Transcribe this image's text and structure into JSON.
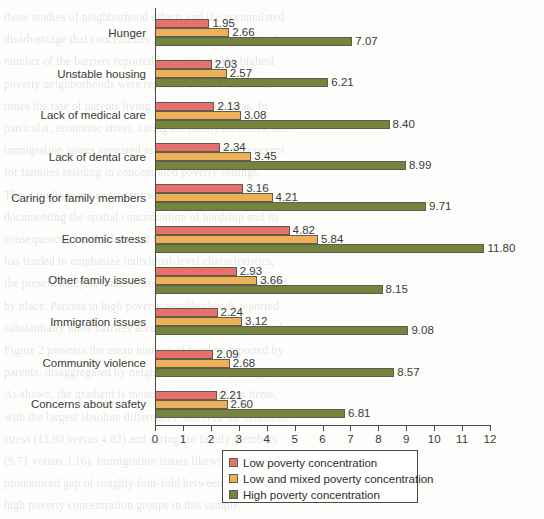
{
  "chart_data": {
    "type": "bar",
    "orientation": "horizontal",
    "title": "",
    "subtitle": "",
    "xlabel": "",
    "ylabel": "",
    "xlim": [
      0,
      12
    ],
    "xticks": [
      "0",
      "1",
      "2",
      "3",
      "4",
      "5",
      "6",
      "7",
      "8",
      "9",
      "10",
      "11",
      "12"
    ],
    "grid": false,
    "legend_position": "bottom",
    "categories": [
      "Hunger",
      "Unstable housing",
      "Lack of medical care",
      "Lack of dental care",
      "Caring for family members",
      "Economic stress",
      "Other family issues",
      "Immigration issues",
      "Community violence",
      "Concerns about safety"
    ],
    "series": [
      {
        "name": "Low poverty concentration",
        "color": "#e8706a",
        "values": [
          1.95,
          2.03,
          2.13,
          2.34,
          3.16,
          4.82,
          2.93,
          2.24,
          2.09,
          2.21
        ],
        "labels": [
          "1.95",
          "2.03",
          "2.13",
          "2.34",
          "3.16",
          "4.82",
          "2.93",
          "2.24",
          "2.09",
          "2.21"
        ]
      },
      {
        "name": "Low and mixed poverty concentration",
        "color": "#eeb055",
        "values": [
          2.66,
          2.57,
          3.08,
          3.45,
          4.21,
          5.84,
          3.66,
          3.12,
          2.68,
          2.6
        ],
        "labels": [
          "2.66",
          "2.57",
          "3.08",
          "3.45",
          "4.21",
          "5.84",
          "3.66",
          "3.12",
          "2.68",
          "2.60"
        ]
      },
      {
        "name": "High poverty concentration",
        "color": "#74843c",
        "values": [
          7.07,
          6.21,
          8.4,
          8.99,
          9.71,
          11.8,
          8.15,
          9.08,
          8.57,
          6.81
        ],
        "labels": [
          "7.07",
          "6.21",
          "8.40",
          "8.99",
          "9.71",
          "11.80",
          "8.15",
          "9.08",
          "8.57",
          "6.81"
        ]
      }
    ]
  },
  "legend": {
    "items": [
      {
        "label": "Low poverty concentration"
      },
      {
        "label": "Low and mixed poverty concentration"
      },
      {
        "label": "High poverty concentration"
      }
    ]
  },
  "background_text": [
    "those studies of neighborhood effects and the accumulated",
    "disadvantage that concentrates in areas of high poverty. A",
    "number of the barriers reported by parents in the highest",
    "poverty neighborhoods were reported at more than three",
    "times the rate of parents living in low poverty areas. In",
    "particular, economic stress, caring for family members, and",
    "immigration issues appeared as especially salient concerns",
    "for families residing in concentrated poverty settings.",
    "",
    "These findings are consistent with a growing literature",
    "documenting the spatial concentration of hardship and its",
    "consequences for children and families. Whereas prior work",
    "has tended to emphasize individual-level characteristics,",
    "the present analysis underscores the added burden imposed",
    "by place. Parents in high poverty neighborhoods reported",
    "substantially more barriers across every domain measured.",
    "",
    "Figure 2 presents the mean number of barriers reported by",
    "parents, disaggregated by neighborhood poverty category.",
    "As shown, the gradient is monotonic across all ten items,",
    "with the largest absolute differences observed for economic",
    "stress (11.80 versus 4.82) and caring for family members",
    "(9.71 versus 3.16). Immigration issues likewise showed a",
    "pronounced gap of roughly four-fold between the low and",
    "high poverty concentration groups in this sample.",
    "",
    "Taken together, these patterns point to the importance of",
    "place-based intervention strategies. Programs that address",
    "only individual deficits, without attending to the broader",
    "neighborhood context, may be insufficient to close the gaps",
    "documented here. We return to this point in the discussion."
  ]
}
